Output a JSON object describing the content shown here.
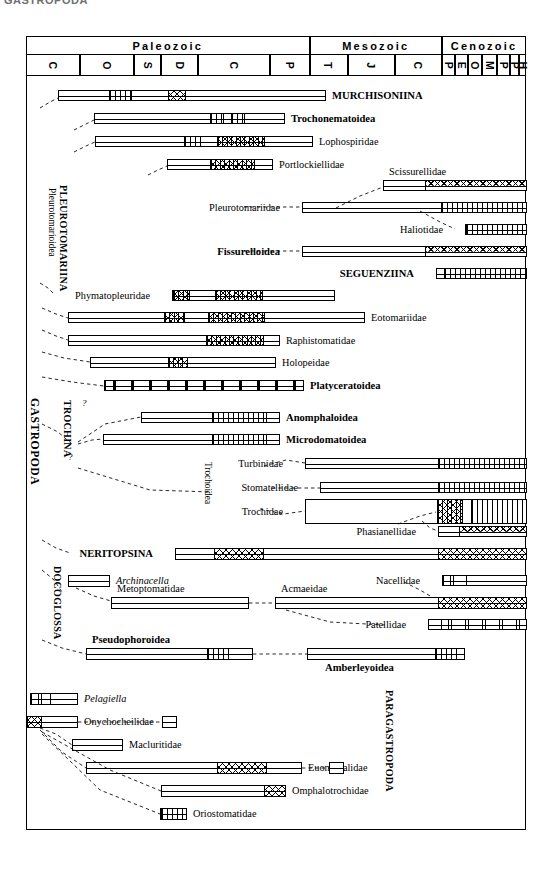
{
  "figure": {
    "cutoff_title": "GASTROPODA",
    "chart_kind": "stratigraphic-range-chart"
  },
  "timescale": {
    "eras": [
      {
        "label": "Paleozoic",
        "x": 0,
        "w": 283.5
      },
      {
        "label": "Mesozoic",
        "x": 283.5,
        "w": 132.5
      },
      {
        "label": "Cenozoic",
        "x": 416,
        "w": 84
      }
    ],
    "periods": [
      {
        "label": "C",
        "name": "Cambrian",
        "x": 0,
        "w": 54
      },
      {
        "label": "O",
        "name": "Ordovician",
        "x": 54,
        "w": 54
      },
      {
        "label": "S",
        "name": "Silurian",
        "x": 108,
        "w": 27
      },
      {
        "label": "D",
        "name": "Devonian",
        "x": 135,
        "w": 37
      },
      {
        "label": "C",
        "name": "Carboniferous",
        "x": 172,
        "w": 72
      },
      {
        "label": "P",
        "name": "Permian",
        "x": 244,
        "w": 39.5
      },
      {
        "label": "T",
        "name": "Triassic",
        "x": 283.5,
        "w": 38
      },
      {
        "label": "J",
        "name": "Jurassic",
        "x": 321.5,
        "w": 47
      },
      {
        "label": "C",
        "name": "Cretaceous",
        "x": 368.5,
        "w": 47.5
      },
      {
        "label": "P",
        "name": "Paleocene",
        "x": 416,
        "w": 13
      },
      {
        "label": "E",
        "name": "Eocene",
        "x": 429,
        "w": 13
      },
      {
        "label": "O",
        "name": "Oligocene",
        "x": 442,
        "w": 14
      },
      {
        "label": "M",
        "name": "Miocene",
        "x": 456,
        "w": 15
      },
      {
        "label": "P",
        "name": "Pliocene",
        "x": 471,
        "w": 13
      },
      {
        "label": "P",
        "name": "Pleistocene",
        "x": 484,
        "w": 9
      },
      {
        "label": "H",
        "name": "Holocene",
        "x": 493,
        "w": 7
      }
    ]
  },
  "group_labels": [
    {
      "id": "gastropoda",
      "text": "GASTROPODA",
      "size": "big"
    },
    {
      "id": "pleurotomariina",
      "text": "PLEUROTOMARIINA",
      "size": "mid"
    },
    {
      "id": "pleurotomarioidea",
      "text": "Pleurotomarioidea",
      "size": "sm"
    },
    {
      "id": "trochina",
      "text": "TROCHINA",
      "size": "mid"
    },
    {
      "id": "trochoidea",
      "text": "Trochoidea",
      "size": "sm"
    },
    {
      "id": "docoglossa",
      "text": "DOCOGLOSSA",
      "size": "mid"
    },
    {
      "id": "paragastropoda",
      "text": "PARAGASTROPODA",
      "size": "mid"
    }
  ],
  "taxa": [
    {
      "id": "murchisoniina",
      "name": "MURCHISONIINA",
      "bold": true,
      "italic": false,
      "side": "right",
      "bar": {
        "x": 58,
        "w": 268,
        "y": 90,
        "h": 11
      }
    },
    {
      "id": "trochonematoidea",
      "name": "Trochonematoidea",
      "bold": true,
      "italic": false,
      "side": "right",
      "bar": {
        "x": 94,
        "w": 191,
        "y": 113,
        "h": 11
      }
    },
    {
      "id": "lophospiridae",
      "name": "Lophospiridae",
      "bold": false,
      "italic": false,
      "side": "right",
      "bar": {
        "x": 95,
        "w": 218,
        "y": 136,
        "h": 11
      }
    },
    {
      "id": "portlockiellidae",
      "name": "Portlockiellidae",
      "bold": false,
      "italic": false,
      "side": "right",
      "bar": {
        "x": 167,
        "w": 106,
        "y": 159,
        "h": 11
      }
    },
    {
      "id": "scissurellidae",
      "name": "Scissurellidae",
      "bold": false,
      "italic": false,
      "side": "above",
      "bar": {
        "x": 383,
        "w": 144,
        "y": 180,
        "h": 11
      }
    },
    {
      "id": "pleurotomariidae",
      "name": "Pleurotomariidae",
      "bold": false,
      "italic": false,
      "side": "left",
      "bar": {
        "x": 302,
        "w": 225,
        "y": 202,
        "h": 11
      }
    },
    {
      "id": "haliotidae",
      "name": "Haliotidae",
      "bold": false,
      "italic": false,
      "side": "left",
      "bar": {
        "x": 465,
        "w": 62,
        "y": 224,
        "h": 11
      }
    },
    {
      "id": "fissurelloidea",
      "name": "Fissurelloidea",
      "bold": true,
      "italic": false,
      "side": "left",
      "bar": {
        "x": 302,
        "w": 225,
        "y": 246,
        "h": 11
      }
    },
    {
      "id": "seguenziina",
      "name": "SEGUENZIINA",
      "bold": true,
      "italic": false,
      "side": "left",
      "bar": {
        "x": 436,
        "w": 91,
        "y": 268,
        "h": 11
      }
    },
    {
      "id": "phymatopleuridae",
      "name": "Phymatopleuridae",
      "bold": false,
      "italic": false,
      "side": "left",
      "bar": {
        "x": 172,
        "w": 163,
        "y": 290,
        "h": 11
      }
    },
    {
      "id": "eotomariidae",
      "name": "Eotomariidae",
      "bold": false,
      "italic": false,
      "side": "right",
      "bar": {
        "x": 68,
        "w": 297,
        "y": 312,
        "h": 11
      }
    },
    {
      "id": "raphistomatidae",
      "name": "Raphistomatidae",
      "bold": false,
      "italic": false,
      "side": "right",
      "bar": {
        "x": 68,
        "w": 212,
        "y": 335,
        "h": 11
      }
    },
    {
      "id": "holopeidae",
      "name": "Holopeidae",
      "bold": false,
      "italic": false,
      "side": "right",
      "bar": {
        "x": 90,
        "w": 186,
        "y": 357,
        "h": 11
      }
    },
    {
      "id": "platyceratoidea",
      "name": "Platyceratoidea",
      "bold": true,
      "italic": false,
      "side": "right",
      "bar": {
        "x": 104,
        "w": 200,
        "y": 380,
        "h": 11
      }
    },
    {
      "id": "anomphaloidea",
      "name": "Anomphaloidea",
      "bold": true,
      "italic": false,
      "side": "right",
      "bar": {
        "x": 141,
        "w": 139,
        "y": 412,
        "h": 11
      }
    },
    {
      "id": "microdomatoidea",
      "name": "Microdomatoidea",
      "bold": true,
      "italic": false,
      "side": "right",
      "bar": {
        "x": 103,
        "w": 177,
        "y": 434,
        "h": 11
      }
    },
    {
      "id": "turbinidae",
      "name": "Turbinidae",
      "bold": false,
      "italic": false,
      "side": "left",
      "bar": {
        "x": 305,
        "w": 222,
        "y": 458,
        "h": 11
      }
    },
    {
      "id": "stomatellidae",
      "name": "Stomatellidae",
      "bold": false,
      "italic": false,
      "side": "left",
      "bar": {
        "x": 320,
        "w": 207,
        "y": 482,
        "h": 11
      }
    },
    {
      "id": "trochidae",
      "name": "Trochidae",
      "bold": false,
      "italic": false,
      "side": "left",
      "bar": {
        "x": 305,
        "w": 222,
        "y": 499,
        "h": 25
      }
    },
    {
      "id": "phasianellidae",
      "name": "Phasianellidae",
      "bold": false,
      "italic": false,
      "side": "left",
      "bar": {
        "x": 438,
        "w": 89,
        "y": 526,
        "h": 11
      }
    },
    {
      "id": "neritopsina",
      "name": "NERITOPSINA",
      "bold": true,
      "italic": false,
      "side": "left",
      "bar": {
        "x": 175,
        "w": 352,
        "y": 548,
        "h": 12
      }
    },
    {
      "id": "archinacella",
      "name": "Archinacella",
      "bold": false,
      "italic": true,
      "side": "right",
      "bar": {
        "x": 68,
        "w": 42,
        "y": 575,
        "h": 12
      }
    },
    {
      "id": "nacellidae",
      "name": "Nacellidae",
      "bold": false,
      "italic": false,
      "side": "left",
      "bar": {
        "x": 442,
        "w": 85,
        "y": 575,
        "h": 11
      }
    },
    {
      "id": "metoptomatidae",
      "name": "Metoptomatidae",
      "bold": false,
      "italic": false,
      "side": "above",
      "bar": {
        "x": 111,
        "w": 138,
        "y": 597,
        "h": 12
      }
    },
    {
      "id": "acmaeidae",
      "name": "Acmaeidae",
      "bold": false,
      "italic": false,
      "side": "above",
      "bar": {
        "x": 275,
        "w": 252,
        "y": 597,
        "h": 12
      }
    },
    {
      "id": "patellidae",
      "name": "Patellidae",
      "bold": false,
      "italic": false,
      "side": "left",
      "bar": {
        "x": 428,
        "w": 99,
        "y": 619,
        "h": 11
      }
    },
    {
      "id": "pseudophoroidea",
      "name": "Pseudophoroidea",
      "bold": true,
      "italic": false,
      "side": "above",
      "bar": {
        "x": 86,
        "w": 167,
        "y": 648,
        "h": 12
      }
    },
    {
      "id": "amberleyoidea",
      "name": "Amberleyoidea",
      "bold": true,
      "italic": false,
      "side": "below",
      "bar": {
        "x": 307,
        "w": 158,
        "y": 648,
        "h": 12
      }
    },
    {
      "id": "pelagiella",
      "name": "Pelagiella",
      "bold": false,
      "italic": true,
      "side": "right",
      "bar": {
        "x": 30,
        "w": 48,
        "y": 693,
        "h": 12
      }
    },
    {
      "id": "onychocheilidae",
      "name": "Onychocheilidae",
      "bold": false,
      "italic": false,
      "side": "right",
      "bar": {
        "x": 26,
        "w": 52,
        "y": 716,
        "h": 12
      }
    },
    {
      "id": "onychocheilidae_box",
      "name": "",
      "bold": false,
      "italic": false,
      "side": "none",
      "bar": {
        "x": 162,
        "w": 15,
        "y": 716,
        "h": 12
      }
    },
    {
      "id": "macluritidae",
      "name": "Macluritidae",
      "bold": false,
      "italic": false,
      "side": "right",
      "bar": {
        "x": 72,
        "w": 51,
        "y": 739,
        "h": 12
      }
    },
    {
      "id": "euomphalidae",
      "name": "Euomphalidae",
      "bold": false,
      "italic": false,
      "side": "right",
      "bar": {
        "x": 86,
        "w": 216,
        "y": 762,
        "h": 12
      }
    },
    {
      "id": "euomphalidae_box",
      "name": "",
      "bold": false,
      "italic": false,
      "side": "none",
      "bar": {
        "x": 329,
        "w": 15,
        "y": 762,
        "h": 12
      }
    },
    {
      "id": "omphalotrochidae",
      "name": "Omphalotrochidae",
      "bold": false,
      "italic": false,
      "side": "right",
      "bar": {
        "x": 161,
        "w": 125,
        "y": 785,
        "h": 12
      }
    },
    {
      "id": "oriostomatidae",
      "name": "Oriostomatidae",
      "bold": false,
      "italic": false,
      "side": "right",
      "bar": {
        "x": 160,
        "w": 27,
        "y": 808,
        "h": 12
      }
    }
  ],
  "hatch_segments": [
    {
      "taxon": "murchisoniina",
      "pattern": "vert",
      "x": 108,
      "w": 23
    },
    {
      "taxon": "murchisoniina",
      "pattern": "xs",
      "x": 167,
      "w": 18
    },
    {
      "taxon": "trochonematoidea",
      "pattern": "vert",
      "x": 209,
      "w": 14
    },
    {
      "taxon": "trochonematoidea",
      "pattern": "vert",
      "x": 230,
      "w": 14
    },
    {
      "taxon": "lophospiridae",
      "pattern": "vert",
      "x": 183,
      "w": 17
    },
    {
      "taxon": "lophospiridae",
      "pattern": "xv",
      "x": 216,
      "w": 48
    },
    {
      "taxon": "portlockiellidae",
      "pattern": "xv",
      "x": 209,
      "w": 45
    },
    {
      "taxon": "scissurellidae",
      "pattern": "xtop",
      "x": 424,
      "w": 103
    },
    {
      "taxon": "pleurotomariidae",
      "pattern": "vert",
      "x": 440,
      "w": 87
    },
    {
      "taxon": "haliotidae",
      "pattern": "vert",
      "x": 465,
      "w": 62
    },
    {
      "taxon": "fissurelloidea",
      "pattern": "xtop",
      "x": 424,
      "w": 103
    },
    {
      "taxon": "seguenziina",
      "pattern": "vert",
      "x": 443,
      "w": 84
    },
    {
      "taxon": "phymatopleuridae",
      "pattern": "xv",
      "x": 172,
      "w": 17
    },
    {
      "taxon": "phymatopleuridae",
      "pattern": "xv",
      "x": 214,
      "w": 48
    },
    {
      "taxon": "eotomariidae",
      "pattern": "xv",
      "x": 163,
      "w": 21
    },
    {
      "taxon": "eotomariidae",
      "pattern": "xv",
      "x": 207,
      "w": 57
    },
    {
      "taxon": "raphistomatidae",
      "pattern": "xv",
      "x": 205,
      "w": 58
    },
    {
      "taxon": "holopeidae",
      "pattern": "xv",
      "x": 167,
      "w": 20
    },
    {
      "taxon": "platyceratoidea",
      "pattern": "blocks",
      "x": 104,
      "w": 200
    },
    {
      "taxon": "anomphaloidea",
      "pattern": "vert",
      "x": 211,
      "w": 55
    },
    {
      "taxon": "microdomatoidea",
      "pattern": "vert",
      "x": 211,
      "w": 55
    },
    {
      "taxon": "turbinidae",
      "pattern": "vert",
      "x": 437,
      "w": 90
    },
    {
      "taxon": "stomatellidae",
      "pattern": "vert",
      "x": 437,
      "w": 90
    },
    {
      "taxon": "trochidae",
      "pattern": "xv",
      "x": 436,
      "w": 26
    },
    {
      "taxon": "trochidae",
      "pattern": "vert",
      "x": 470,
      "w": 57
    },
    {
      "taxon": "phasianellidae",
      "pattern": "xtop",
      "x": 458,
      "w": 69
    },
    {
      "taxon": "neritopsina",
      "pattern": "xs",
      "x": 213,
      "w": 50
    },
    {
      "taxon": "neritopsina",
      "pattern": "xs",
      "x": 437,
      "w": 90
    },
    {
      "taxon": "nacellidae",
      "pattern": "sparse",
      "x": 442,
      "w": 24
    },
    {
      "taxon": "acmaeidae",
      "pattern": "xs",
      "x": 437,
      "w": 90
    },
    {
      "taxon": "patellidae",
      "pattern": "sparse",
      "x": 440,
      "w": 87
    },
    {
      "taxon": "pseudophoroidea",
      "pattern": "vert",
      "x": 206,
      "w": 22
    },
    {
      "taxon": "amberleyoidea",
      "pattern": "vert",
      "x": 434,
      "w": 22
    },
    {
      "taxon": "pelagiella",
      "pattern": "sparse",
      "x": 30,
      "w": 20
    },
    {
      "taxon": "onychocheilidae",
      "pattern": "xs",
      "x": 26,
      "w": 15
    },
    {
      "taxon": "euomphalidae",
      "pattern": "xs",
      "x": 216,
      "w": 50
    },
    {
      "taxon": "omphalotrochidae",
      "pattern": "xs",
      "x": 263,
      "w": 23
    },
    {
      "taxon": "oriostomatidae",
      "pattern": "vert",
      "x": 160,
      "w": 27
    }
  ],
  "connectors": [
    {
      "id": "c-murchisoniina",
      "d": "M 40 108 L 50 102 L 58 98"
    },
    {
      "id": "c-trochonematoidea",
      "d": "M 74 130 L 86 124 L 94 120"
    },
    {
      "id": "c-lophospiridae",
      "d": "M 74 152 L 86 146 L 95 142"
    },
    {
      "id": "c-portlockiellidae",
      "d": "M 148 175 L 158 170 L 167 166"
    },
    {
      "id": "c-scissurellidae",
      "d": "M 336 208 L 360 196 L 383 187"
    },
    {
      "id": "c-pleurotomariidae",
      "d": "M 244 207 L 302 207"
    },
    {
      "id": "c-haliotidae",
      "d": "M 420 211 L 440 222 L 455 229"
    },
    {
      "id": "c-fissurelloidea",
      "d": "M 244 251 L 302 251"
    },
    {
      "id": "c-phymatopleuridae",
      "d": "M 40 283 L 48 288 L 54 294"
    },
    {
      "id": "c-eotomariidae",
      "d": "M 42 308 L 56 314 L 68 318"
    },
    {
      "id": "c-raphistomatidae",
      "d": "M 42 330 L 56 336 L 68 340"
    },
    {
      "id": "c-holopeidae",
      "d": "M 42 352 L 64 358 L 90 362"
    },
    {
      "id": "c-platyceratoidea",
      "d": "M 42 377 L 72 382 L 104 386"
    },
    {
      "id": "c-anomphaloidea",
      "d": "M 78 442 L 105 424 L 141 417"
    },
    {
      "id": "c-microdomatoidea",
      "d": "M 78 444 L 92 440 L 103 439"
    },
    {
      "id": "c-gastro-trochina",
      "d": "M 42 424 L 58 432 L 72 444"
    },
    {
      "id": "c-turbinidae",
      "d": "M 264 466 L 286 460 L 305 463"
    },
    {
      "id": "c-stomatellidae",
      "d": "M 272 488 L 320 488"
    },
    {
      "id": "c-trochidae",
      "d": "M 260 509 L 284 514 L 305 511"
    },
    {
      "id": "c-trochoidea-in",
      "d": "M 78 468 L 150 490 L 212 492"
    },
    {
      "id": "c-phasianellidae",
      "d": "M 422 521 L 430 528 L 438 531"
    },
    {
      "id": "c-trochidae-phas",
      "d": "M 398 524 L 420 516 L 436 512"
    },
    {
      "id": "c-neritopsina",
      "d": "M 42 540 L 56 548 L 70 553"
    },
    {
      "id": "c-archinacella",
      "d": "M 76 588 L 94 596 L 111 601"
    },
    {
      "id": "c-metopto-acmae",
      "d": "M 249 603 L 275 603"
    },
    {
      "id": "c-nacellidae",
      "d": "M 404 582 L 420 590 L 432 597"
    },
    {
      "id": "c-patellidae",
      "d": "M 286 610 L 330 622 L 385 625"
    },
    {
      "id": "c-docoglossa",
      "d": "M 42 570 L 54 580 L 62 592"
    },
    {
      "id": "c-pseudophoroidea",
      "d": "M 42 640 L 62 648 L 86 654"
    },
    {
      "id": "c-pseudo-amber",
      "d": "M 253 654 L 307 654"
    },
    {
      "id": "c-onycho",
      "d": "M 78 722 L 162 722"
    },
    {
      "id": "c-macluritidae",
      "d": "M 40 728 L 56 734 L 72 745"
    },
    {
      "id": "c-euomphalidae",
      "d": "M 40 730 L 62 752 L 86 768"
    },
    {
      "id": "c-euomph-box",
      "d": "M 302 768 L 329 768"
    },
    {
      "id": "c-omphalo",
      "d": "M 42 732 L 110 770 L 161 791"
    },
    {
      "id": "c-oriostomatidae",
      "d": "M 42 734 L 100 790 L 160 814"
    }
  ],
  "question_marks": [
    {
      "id": "qm-trochina-a",
      "text": "?",
      "x": 82,
      "y": 398
    },
    {
      "id": "qm-trochina-b",
      "text": "?",
      "x": 68,
      "y": 452
    }
  ]
}
